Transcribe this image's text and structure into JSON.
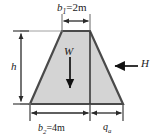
{
  "figure": {
    "colors": {
      "fill": "#d4d4d4",
      "outline": "#4a4a4a",
      "dimension_line": "#2a2a2a",
      "text": "#1b1b1b",
      "background": "#ffffff"
    }
  },
  "labels": {
    "top_width": {
      "symbol": "b",
      "subscript": "1",
      "equals": "=",
      "value": "2m",
      "full": "b1=2m"
    },
    "bottom_width": {
      "symbol": "b",
      "subscript": "2",
      "equals": "=",
      "value": "4m",
      "full": "b2=4m"
    },
    "base_right_segment": {
      "symbol": "q",
      "subscript": "a",
      "full": "qa"
    },
    "height": {
      "symbol": "h",
      "full": "h"
    },
    "weight_force": {
      "symbol": "W",
      "full": "W"
    },
    "horizontal_force": {
      "symbol": "H",
      "full": "H"
    }
  },
  "geometry": {
    "top_left_x": 62,
    "top_right_x": 90,
    "top_y": 31,
    "bottom_left_x": 30,
    "bottom_right_x": 123,
    "bottom_y": 104,
    "internal_vertical_x": 90
  },
  "arrows": {
    "weight_direction": "down",
    "horizontal_force_direction": "left",
    "height_dimension_direction": "vertical-double",
    "top_width_dimension_direction": "horizontal-double",
    "bottom_width_dimension_direction": "horizontal-double"
  }
}
